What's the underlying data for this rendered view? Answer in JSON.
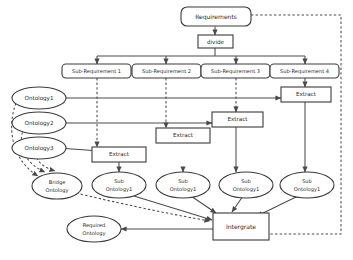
{
  "diagram": {
    "canvas": {
      "width": 353,
      "height": 260
    },
    "colors": {
      "background": "#ffffff",
      "stroke": "#3a3a3a",
      "edge": "#4a4a4a",
      "text": "#2a2a2a"
    },
    "nodes": {
      "requirements": "Requirements",
      "divide": "divide",
      "sub_requirement_1": "Sub-Requirement 1",
      "sub_requirement_2": "Sub-Requirement 2",
      "sub_requirement_3": "Sub-Requirement 3",
      "sub_requirement_4": "Sub-Requirement 4",
      "ontology_1": "Ontology1",
      "ontology_2": "Ontology2",
      "ontology_3": "Ontology3",
      "extract_1": "Extract",
      "extract_2": "Extract",
      "extract_3": "Extract",
      "extract_4": "Extract",
      "bridge_ontology_line1": "Bridge",
      "bridge_ontology_line2": "Ontology",
      "sub_ontology_1_line1": "Sub",
      "sub_ontology_1_line2": "Ontology1",
      "sub_ontology_2_line1": "Sub",
      "sub_ontology_2_line2": "Ontology1",
      "sub_ontology_3_line1": "Sub",
      "sub_ontology_3_line2": "Ontology1",
      "sub_ontology_4_line1": "Sub",
      "sub_ontology_4_line2": "Ontology1",
      "intergrate": "Intergrate",
      "required_ontology_line1": "Required",
      "required_ontology_line2": "Ontology"
    }
  }
}
